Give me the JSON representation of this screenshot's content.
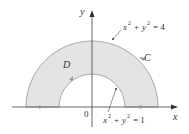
{
  "diagram": {
    "axes": {
      "x_label": "x",
      "y_label": "y",
      "origin_label": "0"
    },
    "region_label": "D",
    "curve_label": "C",
    "outer_circle": {
      "equation_lhs": "x",
      "equation": "x² + y² = 4",
      "parts": {
        "x": "x",
        "y": "y",
        "exp": "2",
        "plus": "+",
        "eq": "= 4"
      }
    },
    "inner_circle": {
      "equation": "x² + y² = 1",
      "parts": {
        "x": "x",
        "y": "y",
        "exp": "2",
        "plus": "+",
        "eq": "= 1"
      }
    },
    "colors": {
      "region_fill": "#e4e4e4",
      "boundary": "#a8a8a8",
      "axis": "#555555",
      "text": "#333333"
    }
  }
}
